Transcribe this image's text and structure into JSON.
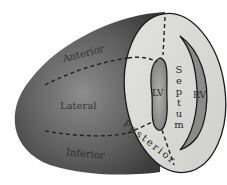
{
  "diagram": {
    "regions": {
      "anterior": "Anterior",
      "lateral": "Lateral",
      "inferior": "Inferior",
      "septum": "Septum",
      "posterior": "Posterior",
      "lv": "LV",
      "rv": "RV"
    },
    "colors": {
      "outer_wall": "#5a5a5a",
      "outer_wall_light": "#8a8a8a",
      "cut_face": "#d9d9d6",
      "cavity": "#9e9e9e",
      "outline": "#1a1a1a",
      "background": "#ffffff"
    }
  }
}
